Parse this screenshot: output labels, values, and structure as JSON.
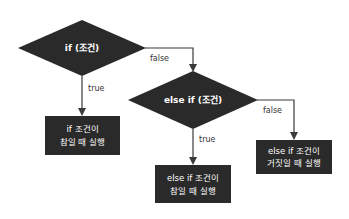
{
  "diagram": {
    "colors": {
      "node_fill": "#2a2a2a",
      "node_text": "#ffffff",
      "edge": "#3a3a3a",
      "label": "#333333",
      "background": "#ffffff"
    },
    "nodes": {
      "if_condition": {
        "type": "decision",
        "label": "if (조건)"
      },
      "else_if_condition": {
        "type": "decision",
        "label": "else if (조건)"
      },
      "if_true_action": {
        "type": "process",
        "lines": [
          "if 조건이",
          "참일 때 실행"
        ]
      },
      "else_if_true_action": {
        "type": "process",
        "lines": [
          "else if 조건이",
          "참일 때 실행"
        ]
      },
      "else_if_false_action": {
        "type": "process",
        "lines": [
          "else if 조건이",
          "거짓일 때 실행"
        ]
      }
    },
    "edges": {
      "if_true": {
        "from": "if_condition",
        "to": "if_true_action",
        "label": "true"
      },
      "if_false": {
        "from": "if_condition",
        "to": "else_if_condition",
        "label": "false"
      },
      "else_if_true": {
        "from": "else_if_condition",
        "to": "else_if_true_action",
        "label": "true"
      },
      "else_if_false": {
        "from": "else_if_condition",
        "to": "else_if_false_action",
        "label": "false"
      }
    }
  }
}
